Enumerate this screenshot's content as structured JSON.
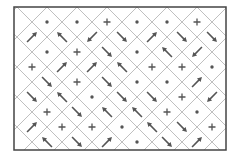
{
  "diagram": {
    "type": "diamond-lattice-vector-field",
    "frame": {
      "x": 14,
      "y": 7,
      "width": 212,
      "height": 143
    },
    "colors": {
      "frame": "#444444",
      "grid": "#b8b8b8",
      "symbol": "#555555",
      "background": "#ffffff"
    },
    "grid_pitch": 30,
    "legend_symbols": {
      "dot": "out-of-plane (•)",
      "plus": "into-plane (+)",
      "arrow": "in-plane direction"
    },
    "cells": [
      {
        "x": 47,
        "y": 22,
        "s": "dot"
      },
      {
        "x": 77,
        "y": 22,
        "s": "dot"
      },
      {
        "x": 107,
        "y": 22,
        "s": "plus"
      },
      {
        "x": 137,
        "y": 22,
        "s": "dot"
      },
      {
        "x": 167,
        "y": 22,
        "s": "dot"
      },
      {
        "x": 197,
        "y": 22,
        "s": "plus"
      },
      {
        "x": 32,
        "y": 37,
        "s": "arrow",
        "a": -45
      },
      {
        "x": 62,
        "y": 37,
        "s": "arrow",
        "a": -135
      },
      {
        "x": 92,
        "y": 37,
        "s": "arrow",
        "a": 135
      },
      {
        "x": 122,
        "y": 37,
        "s": "arrow",
        "a": 45
      },
      {
        "x": 152,
        "y": 37,
        "s": "arrow",
        "a": -45
      },
      {
        "x": 182,
        "y": 37,
        "s": "arrow",
        "a": 45
      },
      {
        "x": 212,
        "y": 37,
        "s": "arrow",
        "a": 45
      },
      {
        "x": 47,
        "y": 52,
        "s": "dot"
      },
      {
        "x": 77,
        "y": 52,
        "s": "plus"
      },
      {
        "x": 107,
        "y": 52,
        "s": "arrow",
        "a": 45
      },
      {
        "x": 137,
        "y": 52,
        "s": "dot"
      },
      {
        "x": 167,
        "y": 52,
        "s": "arrow",
        "a": -135
      },
      {
        "x": 197,
        "y": 52,
        "s": "arrow",
        "a": 135
      },
      {
        "x": 32,
        "y": 67,
        "s": "plus"
      },
      {
        "x": 62,
        "y": 67,
        "s": "arrow",
        "a": -45
      },
      {
        "x": 92,
        "y": 67,
        "s": "arrow",
        "a": -45
      },
      {
        "x": 122,
        "y": 67,
        "s": "arrow",
        "a": -135
      },
      {
        "x": 152,
        "y": 67,
        "s": "plus"
      },
      {
        "x": 182,
        "y": 67,
        "s": "plus"
      },
      {
        "x": 212,
        "y": 67,
        "s": "dot"
      },
      {
        "x": 47,
        "y": 82,
        "s": "arrow",
        "a": 45
      },
      {
        "x": 77,
        "y": 82,
        "s": "plus"
      },
      {
        "x": 107,
        "y": 82,
        "s": "arrow",
        "a": 45
      },
      {
        "x": 137,
        "y": 82,
        "s": "dot"
      },
      {
        "x": 167,
        "y": 82,
        "s": "dot"
      },
      {
        "x": 197,
        "y": 82,
        "s": "arrow",
        "a": -45
      },
      {
        "x": 32,
        "y": 97,
        "s": "arrow",
        "a": 45
      },
      {
        "x": 62,
        "y": 97,
        "s": "arrow",
        "a": -135
      },
      {
        "x": 92,
        "y": 97,
        "s": "dot"
      },
      {
        "x": 122,
        "y": 97,
        "s": "arrow",
        "a": 45
      },
      {
        "x": 152,
        "y": 97,
        "s": "arrow",
        "a": 45
      },
      {
        "x": 182,
        "y": 97,
        "s": "plus"
      },
      {
        "x": 212,
        "y": 97,
        "s": "arrow",
        "a": 135
      },
      {
        "x": 47,
        "y": 112,
        "s": "plus"
      },
      {
        "x": 77,
        "y": 112,
        "s": "arrow",
        "a": 45
      },
      {
        "x": 107,
        "y": 112,
        "s": "arrow",
        "a": -135
      },
      {
        "x": 137,
        "y": 112,
        "s": "arrow",
        "a": -135
      },
      {
        "x": 167,
        "y": 112,
        "s": "plus"
      },
      {
        "x": 197,
        "y": 112,
        "s": "dot"
      },
      {
        "x": 32,
        "y": 127,
        "s": "arrow",
        "a": -45
      },
      {
        "x": 62,
        "y": 127,
        "s": "plus"
      },
      {
        "x": 92,
        "y": 127,
        "s": "plus"
      },
      {
        "x": 122,
        "y": 127,
        "s": "dot"
      },
      {
        "x": 152,
        "y": 127,
        "s": "arrow",
        "a": -135
      },
      {
        "x": 182,
        "y": 127,
        "s": "arrow",
        "a": 45
      },
      {
        "x": 212,
        "y": 127,
        "s": "plus"
      },
      {
        "x": 47,
        "y": 142,
        "s": "arrow",
        "a": -135
      },
      {
        "x": 77,
        "y": 142,
        "s": "arrow",
        "a": 45
      },
      {
        "x": 107,
        "y": 142,
        "s": "arrow",
        "a": -45
      },
      {
        "x": 137,
        "y": 142,
        "s": "dot"
      },
      {
        "x": 167,
        "y": 142,
        "s": "arrow",
        "a": 45
      },
      {
        "x": 197,
        "y": 142,
        "s": "arrow",
        "a": -45
      }
    ]
  }
}
